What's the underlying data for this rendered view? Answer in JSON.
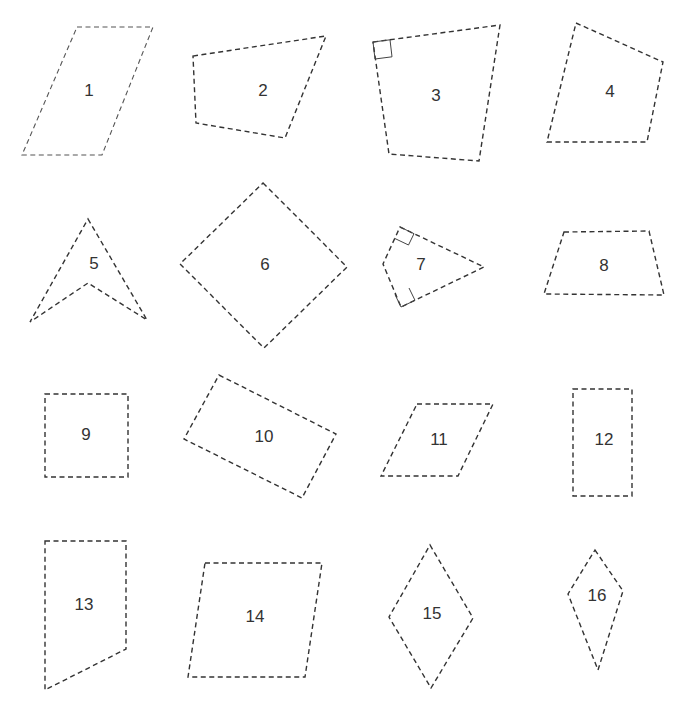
{
  "figure": {
    "width": 687,
    "height": 710,
    "stroke_color": "#333333",
    "background": "#ffffff",
    "shapes": [
      {
        "id": "1",
        "label": "1",
        "kind": "parallelogram",
        "points": [
          [
            77,
            27
          ],
          [
            153,
            27
          ],
          [
            102,
            155
          ],
          [
            22,
            155
          ]
        ],
        "label_pos": [
          89,
          92
        ],
        "style": "light"
      },
      {
        "id": "2",
        "label": "2",
        "kind": "quadrilateral",
        "points": [
          [
            193,
            56
          ],
          [
            326,
            36
          ],
          [
            285,
            138
          ],
          [
            196,
            123
          ]
        ],
        "label_pos": [
          263,
          92
        ]
      },
      {
        "id": "3",
        "label": "3",
        "kind": "quadrilateral",
        "points": [
          [
            373,
            42
          ],
          [
            500,
            25
          ],
          [
            479,
            161
          ],
          [
            389,
            154
          ]
        ],
        "label_pos": [
          436,
          97
        ],
        "right_angles": [
          [
            373,
            42,
            1,
            1
          ]
        ]
      },
      {
        "id": "4",
        "label": "4",
        "kind": "quadrilateral",
        "points": [
          [
            576,
            23
          ],
          [
            663,
            62
          ],
          [
            647,
            142
          ],
          [
            547,
            142
          ]
        ],
        "label_pos": [
          610,
          93
        ]
      },
      {
        "id": "5",
        "label": "5",
        "kind": "concave-quadrilateral",
        "points": [
          [
            88,
            219
          ],
          [
            147,
            320
          ],
          [
            88,
            283
          ],
          [
            30,
            322
          ]
        ],
        "label_pos": [
          94,
          265
        ]
      },
      {
        "id": "6",
        "label": "6",
        "kind": "square",
        "points": [
          [
            263,
            183
          ],
          [
            347,
            267
          ],
          [
            264,
            348
          ],
          [
            180,
            264
          ]
        ],
        "label_pos": [
          265,
          266
        ]
      },
      {
        "id": "7",
        "label": "7",
        "kind": "kite",
        "points": [
          [
            400,
            227
          ],
          [
            484,
            267
          ],
          [
            401,
            307
          ],
          [
            383,
            264
          ]
        ],
        "label_pos": [
          421,
          266
        ],
        "right_angles": [
          [
            400,
            227,
            "top"
          ],
          [
            401,
            307,
            "bottom"
          ]
        ]
      },
      {
        "id": "8",
        "label": "8",
        "kind": "trapezoid",
        "points": [
          [
            564,
            232
          ],
          [
            649,
            231
          ],
          [
            664,
            295
          ],
          [
            544,
            294
          ]
        ],
        "label_pos": [
          604,
          267
        ]
      },
      {
        "id": "9",
        "label": "9",
        "kind": "square",
        "points": [
          [
            45,
            394
          ],
          [
            128,
            394
          ],
          [
            128,
            477
          ],
          [
            45,
            477
          ]
        ],
        "label_pos": [
          86,
          436
        ]
      },
      {
        "id": "10",
        "label": "10",
        "kind": "rectangle",
        "points": [
          [
            219,
            375
          ],
          [
            336,
            434
          ],
          [
            302,
            498
          ],
          [
            184,
            439
          ]
        ],
        "label_pos": [
          264,
          438
        ]
      },
      {
        "id": "11",
        "label": "11",
        "kind": "parallelogram",
        "points": [
          [
            417,
            404
          ],
          [
            493,
            404
          ],
          [
            458,
            476
          ],
          [
            381,
            476
          ]
        ],
        "label_pos": [
          439,
          441
        ]
      },
      {
        "id": "12",
        "label": "12",
        "kind": "rectangle",
        "points": [
          [
            573,
            389
          ],
          [
            632,
            389
          ],
          [
            632,
            496
          ],
          [
            573,
            496
          ]
        ],
        "label_pos": [
          604,
          441
        ]
      },
      {
        "id": "13",
        "label": "13",
        "kind": "trapezoid",
        "points": [
          [
            45,
            541
          ],
          [
            126,
            541
          ],
          [
            126,
            649
          ],
          [
            45,
            690
          ]
        ],
        "label_pos": [
          84,
          606
        ]
      },
      {
        "id": "14",
        "label": "14",
        "kind": "parallelogram",
        "points": [
          [
            205,
            563
          ],
          [
            322,
            563
          ],
          [
            305,
            677
          ],
          [
            188,
            677
          ]
        ],
        "label_pos": [
          255,
          618
        ]
      },
      {
        "id": "15",
        "label": "15",
        "kind": "rhombus",
        "points": [
          [
            430,
            545
          ],
          [
            473,
            618
          ],
          [
            431,
            688
          ],
          [
            389,
            617
          ]
        ],
        "label_pos": [
          432,
          615
        ]
      },
      {
        "id": "16",
        "label": "16",
        "kind": "kite",
        "points": [
          [
            595,
            550
          ],
          [
            623,
            591
          ],
          [
            598,
            670
          ],
          [
            568,
            594
          ]
        ],
        "label_pos": [
          597,
          597
        ]
      }
    ]
  }
}
